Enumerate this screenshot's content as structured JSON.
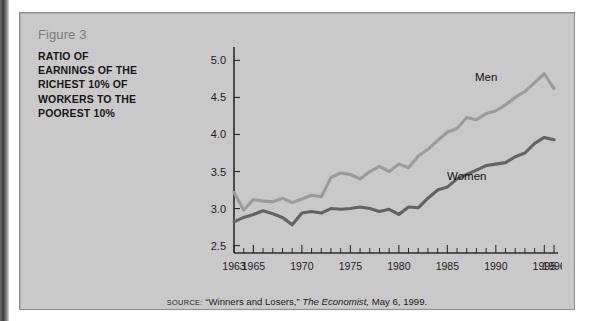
{
  "figure": {
    "number_label": "Figure 3",
    "title": "RATIO OF EARNINGS OF THE RICHEST 10% OF WORKERS TO THE POOREST 10%",
    "title_lines": [
      "RATIO OF",
      "EARNINGS OF THE",
      "RICHEST 10% OF",
      "WORKERS TO THE",
      "POOREST 10%"
    ]
  },
  "source": {
    "keyword": "SOURCE:",
    "quoted_title": "“Winners and Losers,”",
    "publication": "The Economist,",
    "date": "May 6, 1999.",
    "full_text": "SOURCE: “Winners and Losers,” The Economist, May 6, 1999."
  },
  "colors": {
    "panel_background": "#c9c9c9",
    "panel_border": "#8d8d8d",
    "men_line": "#9b9b9b",
    "women_line": "#636363",
    "axis": "#2b2b2b",
    "figure_number_text": "#7c7c7c",
    "title_text": "#151515"
  },
  "chart_data": {
    "type": "line",
    "title": "RATIO OF EARNINGS OF THE RICHEST 10% OF WORKERS TO THE POOREST 10%",
    "xlabel": "",
    "ylabel": "",
    "xlim": [
      1963,
      1996
    ],
    "ylim": [
      2.4,
      5.1
    ],
    "yticks": [
      2.5,
      3.0,
      3.5,
      4.0,
      4.5,
      5.0
    ],
    "ytick_labels": [
      "2.5",
      "3.0",
      "3.5",
      "4.0",
      "4.5",
      "5.0"
    ],
    "xticks_labeled": [
      1963,
      1965,
      1970,
      1975,
      1980,
      1985,
      1990,
      1995,
      1996
    ],
    "xtick_labels": [
      "1963",
      "1965",
      "1970",
      "1975",
      "1980",
      "1985",
      "1990",
      "1995",
      "1996"
    ],
    "xticks_minor_every": 1,
    "grid": false,
    "legend": "inline-labels",
    "x": [
      1963,
      1964,
      1965,
      1966,
      1967,
      1968,
      1969,
      1970,
      1971,
      1972,
      1973,
      1974,
      1975,
      1976,
      1977,
      1978,
      1979,
      1980,
      1981,
      1982,
      1983,
      1984,
      1985,
      1986,
      1987,
      1988,
      1989,
      1990,
      1991,
      1992,
      1993,
      1994,
      1995,
      1996
    ],
    "series": [
      {
        "name": "Men",
        "color": "#9b9b9b",
        "label_x": 1989,
        "label_y": 4.72,
        "values": [
          3.22,
          2.98,
          3.12,
          3.1,
          3.09,
          3.14,
          3.08,
          3.13,
          3.18,
          3.16,
          3.42,
          3.48,
          3.46,
          3.4,
          3.5,
          3.57,
          3.5,
          3.6,
          3.55,
          3.71,
          3.8,
          3.92,
          4.03,
          4.08,
          4.23,
          4.2,
          4.28,
          4.32,
          4.4,
          4.5,
          4.58,
          4.7,
          4.82,
          4.62
        ]
      },
      {
        "name": "Women",
        "color": "#636363",
        "label_x": 1987,
        "label_y": 3.39,
        "values": [
          2.82,
          2.88,
          2.92,
          2.97,
          2.93,
          2.88,
          2.78,
          2.94,
          2.96,
          2.94,
          3.0,
          2.99,
          3.0,
          3.02,
          3.0,
          2.96,
          2.99,
          2.92,
          3.02,
          3.01,
          3.14,
          3.25,
          3.29,
          3.4,
          3.46,
          3.52,
          3.58,
          3.6,
          3.62,
          3.7,
          3.75,
          3.88,
          3.96,
          3.93
        ]
      }
    ]
  }
}
